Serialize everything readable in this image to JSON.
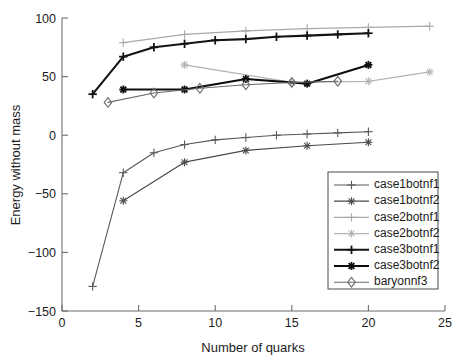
{
  "chart_data": {
    "type": "line",
    "title": "",
    "xlabel": "Number of quarks",
    "ylabel": "Energy without mass",
    "xlim": [
      0,
      25
    ],
    "ylim": [
      -150,
      100
    ],
    "xticks": [
      0,
      5,
      10,
      15,
      20,
      25
    ],
    "yticks": [
      -150,
      -100,
      -50,
      0,
      50,
      100
    ],
    "xtick_labels": [
      "0",
      "5",
      "10",
      "15",
      "20",
      "25"
    ],
    "ytick_labels": [
      "-150",
      "-100",
      "-50",
      "0",
      "50",
      "100"
    ],
    "grid": false,
    "legend_position": "lower-right",
    "series": [
      {
        "name": "case1botnf1",
        "color": "#585858",
        "marker": "plus",
        "line_width": 1.1,
        "x": [
          2,
          4,
          6,
          8,
          10,
          12,
          14,
          16,
          18,
          20
        ],
        "y": [
          -129,
          -32,
          -15,
          -8,
          -4,
          -2,
          0,
          1,
          2,
          3
        ]
      },
      {
        "name": "case1botnf2",
        "color": "#4a4a4a",
        "marker": "asterisk",
        "line_width": 1.2,
        "x": [
          4,
          8,
          12,
          16,
          20
        ],
        "y": [
          -56,
          -23,
          -13,
          -9,
          -6
        ]
      },
      {
        "name": "case2botnf1",
        "color": "#a8a8a8",
        "marker": "plus",
        "line_width": 1.2,
        "x": [
          4,
          8,
          12,
          16,
          20,
          24
        ],
        "y": [
          79,
          86,
          89,
          91,
          92,
          93
        ]
      },
      {
        "name": "case2botnf2",
        "color": "#b4b4b4",
        "marker": "asterisk",
        "line_width": 1.3,
        "x": [
          8,
          15,
          20,
          24
        ],
        "y": [
          60,
          45,
          46,
          54
        ]
      },
      {
        "name": "case3botnf1",
        "color": "#141414",
        "marker": "plus",
        "line_width": 2.1,
        "x": [
          2,
          4,
          6,
          8,
          10,
          12,
          14,
          16,
          18,
          20
        ],
        "y": [
          35,
          67,
          75,
          78,
          81,
          82,
          84,
          85,
          86,
          87
        ]
      },
      {
        "name": "case3botnf2",
        "color": "#0d0d0d",
        "marker": "asterisk",
        "line_width": 2.1,
        "x": [
          4,
          8,
          12,
          16,
          20
        ],
        "y": [
          39,
          39,
          48,
          44,
          60
        ]
      },
      {
        "name": "baryonnf3",
        "color": "#6a6a6a",
        "marker": "diamond",
        "line_width": 1.1,
        "x": [
          3,
          6,
          9,
          12,
          15,
          18
        ],
        "y": [
          28,
          36,
          40,
          43,
          45,
          46
        ]
      }
    ]
  },
  "legend": {
    "entries": [
      {
        "label": "case1botnf1"
      },
      {
        "label": "case1botnf2"
      },
      {
        "label": "case2botnf1"
      },
      {
        "label": "case2botnf2"
      },
      {
        "label": "case3botnf1"
      },
      {
        "label": "case3botnf2"
      },
      {
        "label": "baryonnf3"
      }
    ]
  },
  "axes": {
    "x_title": "Number of quarks",
    "y_title": "Energy without mass"
  }
}
